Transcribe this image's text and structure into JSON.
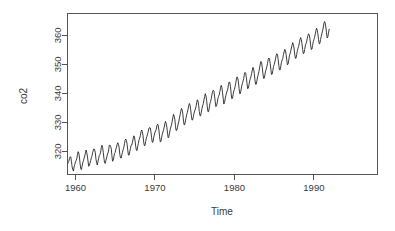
{
  "chart_data": {
    "type": "line",
    "title": "",
    "subtitle": "",
    "xlabel": "Time",
    "ylabel": "co2",
    "xlim": [
      1959.0,
      1998.0
    ],
    "ylim": [
      312.0,
      367.5
    ],
    "grid": false,
    "legend": null,
    "legend_position": "none",
    "line_color": "#1a1a1a",
    "box_color": "#555555",
    "background": "#ffffff",
    "xticks": [
      1960,
      1970,
      1980,
      1990
    ],
    "xtick_labels": [
      "1960",
      "1970",
      "1980",
      "1990"
    ],
    "yticks": [
      320,
      330,
      340,
      350,
      360
    ],
    "ytick_labels": [
      "320",
      "330",
      "340",
      "350",
      "360"
    ],
    "series_name": "co2",
    "x_units": "decimal year (monthly)",
    "y_units": "ppm",
    "x_start": 1959.0,
    "x_step": 0.08333333,
    "values": [
      315.42,
      316.31,
      316.5,
      317.56,
      318.13,
      318.0,
      316.39,
      314.65,
      313.68,
      313.18,
      314.66,
      315.43,
      316.27,
      316.81,
      317.42,
      318.87,
      319.87,
      319.43,
      318.01,
      315.74,
      314.0,
      313.68,
      314.84,
      316.03,
      316.73,
      317.54,
      318.38,
      319.31,
      320.42,
      319.61,
      318.42,
      316.63,
      314.83,
      315.16,
      315.94,
      316.85,
      317.78,
      318.4,
      319.53,
      320.42,
      320.85,
      320.45,
      319.45,
      317.25,
      316.11,
      315.27,
      316.53,
      317.53,
      318.58,
      318.92,
      319.7,
      321.22,
      322.08,
      321.31,
      319.58,
      317.61,
      316.05,
      315.83,
      316.88,
      317.7,
      318.71,
      319.41,
      320.07,
      322.02,
      322.16,
      321.72,
      321.02,
      318.55,
      316.59,
      316.8,
      317.98,
      319.34,
      319.58,
      320.74,
      321.41,
      322.45,
      322.95,
      322.33,
      321.23,
      318.86,
      317.76,
      317.64,
      318.86,
      319.61,
      320.56,
      321.35,
      322.61,
      323.85,
      324.2,
      323.7,
      322.41,
      320.38,
      318.7,
      318.7,
      319.81,
      321.05,
      322.03,
      322.14,
      322.97,
      324.28,
      325.33,
      325.03,
      323.57,
      321.69,
      320.35,
      320.28,
      321.69,
      322.77,
      323.93,
      324.56,
      325.4,
      326.76,
      327.35,
      326.82,
      325.38,
      323.24,
      321.92,
      322.01,
      323.32,
      324.59,
      325.16,
      326.14,
      326.92,
      328.02,
      328.15,
      328.05,
      326.61,
      324.65,
      323.1,
      323.18,
      324.61,
      325.57,
      326.54,
      327.0,
      327.6,
      328.87,
      329.32,
      328.84,
      327.37,
      325.0,
      323.28,
      323.33,
      324.64,
      325.78,
      326.63,
      327.43,
      328.29,
      329.56,
      330.3,
      329.58,
      328.29,
      326.29,
      324.66,
      325.06,
      326.28,
      327.43,
      328.42,
      329.08,
      330.26,
      331.61,
      332.71,
      332.16,
      331.08,
      328.83,
      327.14,
      327.29,
      328.16,
      329.39,
      330.2,
      331.48,
      332.61,
      333.79,
      334.8,
      334.29,
      333.12,
      330.78,
      329.12,
      329.19,
      330.46,
      331.56,
      332.72,
      333.38,
      334.55,
      335.72,
      336.48,
      335.91,
      334.29,
      332.32,
      330.75,
      330.88,
      331.95,
      333.15,
      333.94,
      334.55,
      335.36,
      336.78,
      337.75,
      337.33,
      335.88,
      333.67,
      332.26,
      332.24,
      333.49,
      334.79,
      335.64,
      336.46,
      337.7,
      338.85,
      339.84,
      339.1,
      337.6,
      335.48,
      333.68,
      333.66,
      334.93,
      336.43,
      337.16,
      338.12,
      339.43,
      340.64,
      341.07,
      340.84,
      339.06,
      337.22,
      335.39,
      335.77,
      336.71,
      338.1,
      338.94,
      339.44,
      340.57,
      341.75,
      342.75,
      342.09,
      340.31,
      338.29,
      336.28,
      336.79,
      338.02,
      339.17,
      340.08,
      340.77,
      341.46,
      343.03,
      343.89,
      343.77,
      342.36,
      340.03,
      338.13,
      338.26,
      339.51,
      340.77,
      341.27,
      342.31,
      343.49,
      344.9,
      345.65,
      345.21,
      343.93,
      341.68,
      339.88,
      339.93,
      341.16,
      342.49,
      343.36,
      344.14,
      345.04,
      346.54,
      347.21,
      346.86,
      345.47,
      343.35,
      341.56,
      341.81,
      342.94,
      344.25,
      345.06,
      345.76,
      346.85,
      347.99,
      348.92,
      348.34,
      346.87,
      344.61,
      343.13,
      343.12,
      344.4,
      345.62,
      346.5,
      347.51,
      348.68,
      350.07,
      350.98,
      350.52,
      348.94,
      346.86,
      345.14,
      345.15,
      346.38,
      347.66,
      348.27,
      349.24,
      350.34,
      351.71,
      352.15,
      351.85,
      350.28,
      348.28,
      346.5,
      346.61,
      347.86,
      349.24,
      349.9,
      350.79,
      351.87,
      353.01,
      353.64,
      353.31,
      351.71,
      349.68,
      348.11,
      348.07,
      349.35,
      350.71,
      351.47,
      352.03,
      353.3,
      354.25,
      355.13,
      354.77,
      353.43,
      351.54,
      349.83,
      350.08,
      351.42,
      352.88,
      353.63,
      354.53,
      355.58,
      356.56,
      357.43,
      356.78,
      355.58,
      353.53,
      352.08,
      352.08,
      353.36,
      354.7,
      355.54,
      356.14,
      357.42,
      358.48,
      359.18,
      358.53,
      357.07,
      355.11,
      353.66,
      353.82,
      355.07,
      356.35,
      357.09,
      357.7,
      358.98,
      359.95,
      360.5,
      360.01,
      358.77,
      356.66,
      355.1,
      355.25,
      356.48,
      357.83,
      358.51,
      359.26,
      360.36,
      361.58,
      362.39,
      361.74,
      360.52,
      358.61,
      357.04,
      357.16,
      358.52,
      359.57,
      360.54,
      361.44,
      362.49,
      364.0,
      364.71,
      364.29,
      362.82,
      360.78,
      359.09,
      359.43,
      360.72,
      362.06
    ]
  },
  "axes": {
    "y_title": "co2",
    "x_title": "Time"
  }
}
